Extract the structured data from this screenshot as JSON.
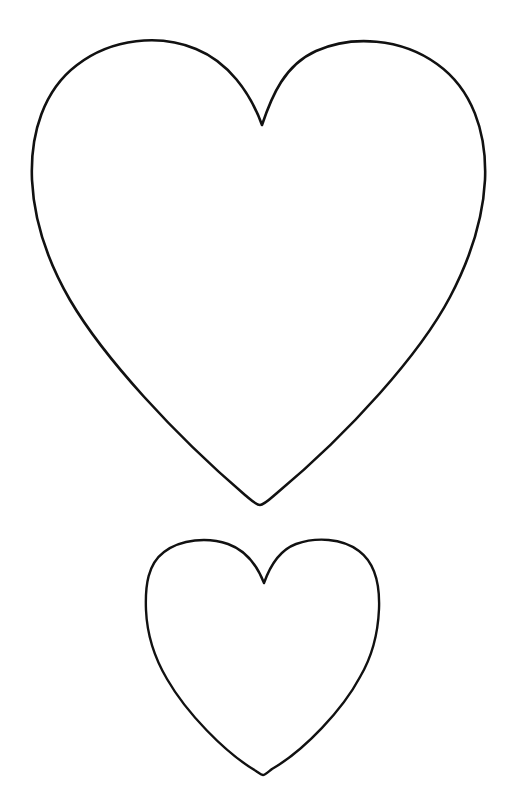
{
  "page": {
    "title": "Heart Template",
    "background_color": "#ffffff",
    "width": 506,
    "height": 794,
    "visible_text": ""
  },
  "style": {
    "stroke_color": "#111111",
    "fill_color": "none",
    "large_stroke_width": "2.6",
    "small_stroke_width": "2.4"
  },
  "shapes": [
    {
      "id": "large-heart",
      "name": "large-heart-outline",
      "label": "Large heart outline",
      "bbox": {
        "x": 32,
        "y": 43,
        "width": 453,
        "height": 463
      },
      "notch": {
        "x": 262,
        "y": 125
      },
      "bottom_tip": {
        "x": 260,
        "y": 505
      },
      "left_lobe_apex": {
        "x": 150,
        "y": 44
      },
      "right_lobe_apex": {
        "x": 360,
        "y": 44
      },
      "leftmost": {
        "x": 32,
        "y": 245
      },
      "rightmost": {
        "x": 485,
        "y": 240
      },
      "path": "M 262 125 C 250 92 228 62 196 49 C 160 34 112 38 77 65 C 44 90 30 133 32 180 C 34 222 48 262 70 300 C 104 358 175 435 245 495 C 251 500 256 505 260 505 C 264 505 270 499 277 493 C 350 432 420 354 450 297 C 470 259 483 219 485 180 C 487 132 472 89 437 64 C 401 38 352 35 316 51 C 285 65 272 95 262 125 Z"
    },
    {
      "id": "small-heart",
      "name": "small-heart-outline",
      "label": "Small heart outline",
      "bbox": {
        "x": 146,
        "y": 541,
        "width": 233,
        "height": 235
      },
      "notch": {
        "x": 264,
        "y": 583
      },
      "bottom_tip": {
        "x": 263,
        "y": 775
      },
      "left_lobe_apex": {
        "x": 205,
        "y": 545
      },
      "right_lobe_apex": {
        "x": 322,
        "y": 544
      },
      "leftmost": {
        "x": 146,
        "y": 628
      },
      "rightmost": {
        "x": 379,
        "y": 625
      },
      "path": "M 264 583 C 257 565 245 550 228 544 C 208 537 181 539 164 552 C 148 564 145 585 146 610 C 147 634 154 657 167 679 C 186 712 224 752 256 771 C 259 773 261 775 263 775 C 265 775 268 772 272 769 C 305 750 343 709 360 677 C 373 655 378 633 379 609 C 380 584 375 563 359 551 C 342 538 316 537 296 544 C 280 550 270 566 264 583 Z"
    }
  ]
}
